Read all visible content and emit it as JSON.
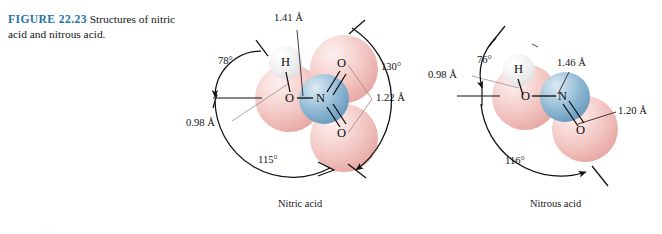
{
  "caption": {
    "figure_number": "FIGURE 22.23",
    "text": "Structures of nitric acid and nitrous acid."
  },
  "molecules": [
    {
      "name": "Nitric acid",
      "formula_atoms": [
        {
          "element": "H",
          "label": "H"
        },
        {
          "element": "O",
          "label": "O"
        },
        {
          "element": "N",
          "label": "N"
        },
        {
          "element": "O",
          "label": "O"
        },
        {
          "element": "O",
          "label": "O"
        }
      ],
      "bond_lengths": [
        {
          "label": "0.98 Å",
          "bond": "O-H"
        },
        {
          "label": "1.41 Å",
          "bond": "O-N"
        },
        {
          "label": "1.22 Å",
          "bond": "N=O"
        }
      ],
      "bond_angles": [
        {
          "label": "78°"
        },
        {
          "label": "115°"
        },
        {
          "label": "130°"
        }
      ]
    },
    {
      "name": "Nitrous acid",
      "formula_atoms": [
        {
          "element": "H",
          "label": "H"
        },
        {
          "element": "O",
          "label": "O"
        },
        {
          "element": "N",
          "label": "N"
        },
        {
          "element": "O",
          "label": "O"
        }
      ],
      "bond_lengths": [
        {
          "label": "0.98 Å",
          "bond": "O-H"
        },
        {
          "label": "1.46 Å",
          "bond": "O-N"
        },
        {
          "label": "1.20 Å",
          "bond": "N=O"
        }
      ],
      "bond_angles": [
        {
          "label": "76°"
        },
        {
          "label": "116°"
        }
      ]
    }
  ],
  "colors": {
    "figure_number": "#2573a7",
    "oxygen": "#eeb5b1",
    "nitrogen": "#7ea9c9",
    "hydrogen": "#e9e9ec",
    "line": "#111111"
  },
  "page_artifact": "···"
}
